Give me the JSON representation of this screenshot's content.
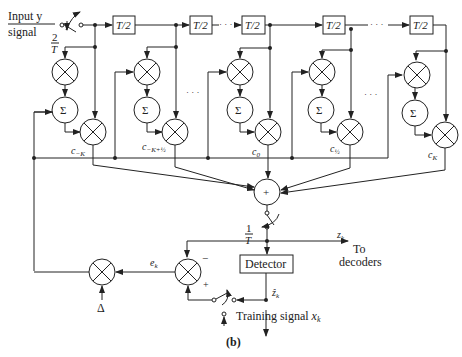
{
  "diagram": {
    "input_label_line1": "Input y",
    "input_label_line2": "signal",
    "sample_rate_in": {
      "num": "2",
      "den": "T"
    },
    "delay_label": "T/2",
    "delays": [
      "T/2",
      "T/2",
      "T/2",
      "T/2",
      "T/2"
    ],
    "sum_symbol": "Σ",
    "adder_symbol": "+",
    "coefficients": [
      {
        "base": "c",
        "sub": "−K"
      },
      {
        "base": "c",
        "sub": "−K+½"
      },
      {
        "base": "c",
        "sub": "0"
      },
      {
        "base": "c",
        "sub": "½"
      },
      {
        "base": "c",
        "sub": "K"
      }
    ],
    "ellipsis": "· · ·",
    "sample_rate_out": {
      "num": "1",
      "den": "T"
    },
    "output_label": {
      "base": "z",
      "sub": "k"
    },
    "output_dest_line1": "To",
    "output_dest_line2": "decoders",
    "detector_label": "Detector",
    "detector_out": {
      "base": "ẑ",
      "sub": "k"
    },
    "error_label": {
      "base": "e",
      "sub": "k"
    },
    "minus_sign": "−",
    "plus_sign": "+",
    "step_size": "Δ",
    "training_label": "Training signal ",
    "training_var": {
      "base": "x",
      "sub": "k"
    },
    "caption": "(b)"
  }
}
